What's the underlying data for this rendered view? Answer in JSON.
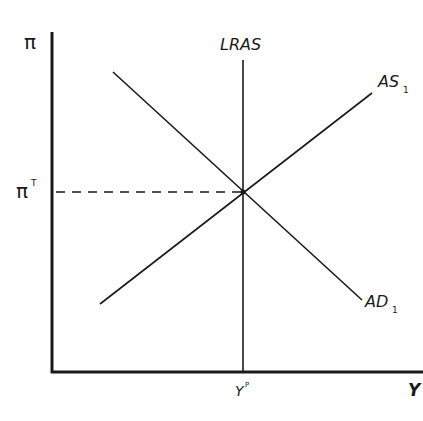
{
  "diagram": {
    "type": "AD-AS model (inflation vs output)",
    "axes": {
      "y_label": "π",
      "x_label": "Y",
      "y_tick_label": "π",
      "y_tick_superscript": "T",
      "x_tick_label": "Y",
      "x_tick_superscript": "P"
    },
    "curves": {
      "lras": {
        "label": "LRAS"
      },
      "as": {
        "label": "AS",
        "subscript": "1"
      },
      "ad": {
        "label": "AD",
        "subscript": "1"
      }
    },
    "equilibrium": {
      "x_label": "Y^P",
      "y_label": "π^T"
    },
    "colors": {
      "line": "#1a1a1a",
      "background": "#ffffff"
    }
  }
}
